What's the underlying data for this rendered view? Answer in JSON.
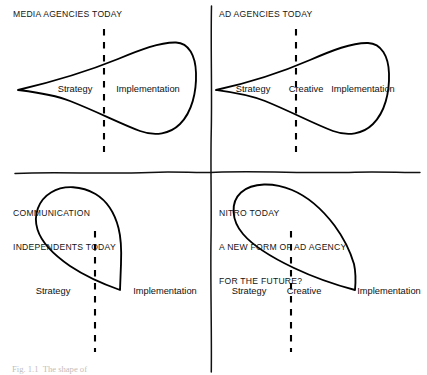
{
  "figure": {
    "caption": "Fig. 1.1  The shape of",
    "background_color": "#ffffff",
    "stroke_color": "#000000"
  },
  "quadrants": {
    "top_left": {
      "title": "MEDIA AGENCIES TODAY",
      "shape": "teardrop-point-left",
      "labels": [
        "Strategy",
        "Implementation"
      ],
      "divider": "dashed-vertical"
    },
    "top_right": {
      "title": "AD AGENCIES TODAY",
      "shape": "teardrop-point-left",
      "labels": [
        "Strategy",
        "Creative",
        "Implementation"
      ],
      "divider": "dashed-vertical"
    },
    "bottom_left": {
      "title_line_1": "COMMUNICATION",
      "title_line_2": "INDEPENDENTS TODAY",
      "shape": "teardrop-point-right",
      "labels": [
        "Strategy",
        "Implementation"
      ],
      "divider": "dashed-vertical"
    },
    "bottom_right": {
      "title_line_1": "NITRO TODAY",
      "title_line_2": "A NEW FORM OF AD AGENCY",
      "title_line_3": "FOR THE FUTURE?",
      "shape": "teardrop-point-right",
      "labels": [
        "Strategy",
        "Creative",
        "Implementation"
      ],
      "divider": "dashed-vertical"
    }
  },
  "labels": {
    "strategy": "Strategy",
    "creative": "Creative",
    "implementation": "Implementation"
  }
}
